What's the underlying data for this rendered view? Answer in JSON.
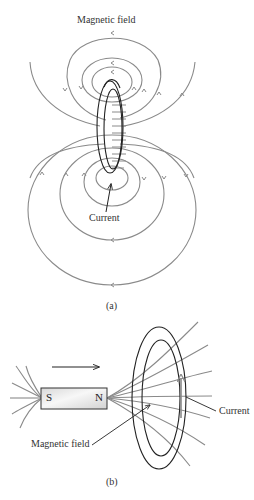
{
  "figure_a": {
    "field_label": "Magnetic field",
    "current_label": "Current",
    "caption": "(a)"
  },
  "figure_b": {
    "south_pole": "S",
    "north_pole": "N",
    "field_label": "Magnetic field",
    "current_label": "Current",
    "caption": "(b)",
    "motion": "magnet moving right toward loop"
  },
  "colors": {
    "field_lines": "#8a8a8a",
    "wire": "#222222",
    "magnet_fill": "#e6e6e6"
  }
}
